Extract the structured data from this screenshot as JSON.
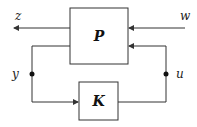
{
  "diagram": {
    "type": "block-diagram",
    "blocks": [
      {
        "id": "P",
        "label": "P"
      },
      {
        "id": "K",
        "label": "K"
      }
    ],
    "signals": {
      "z": "z",
      "w": "w",
      "y": "y",
      "u": "u"
    },
    "colors": {
      "line": "#333333",
      "background": "#ffffff"
    }
  }
}
